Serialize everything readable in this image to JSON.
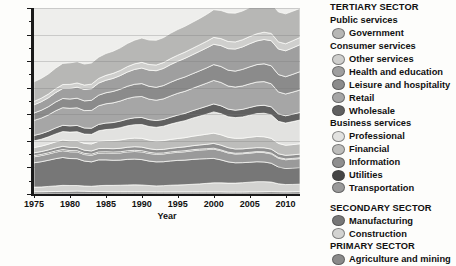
{
  "chart_data": {
    "type": "area",
    "title": "",
    "xlabel": "Year",
    "ylabel": "",
    "xlim": [
      1975,
      2012
    ],
    "ylim": [
      0,
      140
    ],
    "ytick_labels": [
      "0",
      "20",
      "40",
      "60",
      "80",
      "100",
      "120",
      "140"
    ],
    "ytick_values": [
      0,
      20,
      40,
      60,
      80,
      100,
      120,
      140
    ],
    "xtick_labels": [
      "1975",
      "1980",
      "1985",
      "1990",
      "1995",
      "2000",
      "2005",
      "2010"
    ],
    "xtick_values": [
      1975,
      1980,
      1985,
      1990,
      1995,
      2000,
      2005,
      2010
    ],
    "grid": true,
    "stacked": true,
    "legend_position": "right",
    "x": [
      1975,
      1976,
      1977,
      1978,
      1979,
      1980,
      1981,
      1982,
      1983,
      1984,
      1985,
      1986,
      1987,
      1988,
      1989,
      1990,
      1991,
      1992,
      1993,
      1994,
      1995,
      1996,
      1997,
      1998,
      1999,
      2000,
      2001,
      2002,
      2003,
      2004,
      2005,
      2006,
      2007,
      2008,
      2009,
      2010,
      2011,
      2012
    ],
    "series": [
      {
        "name": "Agriculture and mining",
        "sector": "PRIMARY SECTOR",
        "color": "#8a8a8a",
        "values": [
          1.7,
          1.7,
          1.8,
          1.9,
          2.0,
          2.1,
          2.2,
          2.1,
          1.9,
          1.9,
          1.8,
          1.7,
          1.7,
          1.7,
          1.7,
          1.7,
          1.7,
          1.6,
          1.6,
          1.6,
          1.6,
          1.6,
          1.6,
          1.6,
          1.6,
          1.6,
          1.6,
          1.5,
          1.5,
          1.5,
          1.6,
          1.6,
          1.7,
          1.8,
          1.7,
          1.6,
          1.7,
          1.8
        ]
      },
      {
        "name": "Construction",
        "sector": "SECONDARY SECTOR",
        "color": "#d3d3d1",
        "values": [
          3.5,
          3.6,
          3.9,
          4.2,
          4.5,
          4.3,
          4.2,
          3.9,
          3.9,
          4.4,
          4.7,
          4.8,
          4.9,
          5.1,
          5.2,
          5.1,
          4.7,
          4.5,
          4.7,
          5.0,
          5.2,
          5.4,
          5.7,
          6.0,
          6.4,
          6.8,
          6.8,
          6.7,
          6.7,
          7.0,
          7.3,
          7.7,
          7.6,
          7.2,
          6.0,
          5.5,
          5.5,
          5.6
        ]
      },
      {
        "name": "Manufacturing",
        "sector": "SECONDARY SECTOR",
        "color": "#777777",
        "values": [
          18.3,
          19.0,
          19.7,
          20.5,
          21.0,
          20.3,
          20.2,
          18.8,
          18.4,
          19.4,
          19.2,
          18.9,
          18.9,
          19.3,
          19.4,
          19.1,
          18.4,
          18.1,
          18.0,
          18.3,
          18.5,
          18.5,
          18.7,
          18.8,
          18.6,
          18.4,
          17.3,
          16.0,
          15.3,
          15.1,
          15.0,
          15.0,
          14.8,
          14.2,
          12.6,
          12.2,
          12.4,
          12.5
        ]
      },
      {
        "name": "Transportation",
        "sector": "Business services",
        "color": "#9a9a9a",
        "values": [
          4.5,
          4.6,
          4.7,
          4.9,
          5.1,
          5.1,
          5.1,
          4.9,
          4.9,
          5.1,
          5.2,
          5.3,
          5.4,
          5.6,
          5.7,
          5.8,
          5.7,
          5.7,
          5.8,
          6.0,
          6.1,
          6.3,
          6.5,
          6.7,
          6.8,
          7.0,
          6.9,
          6.7,
          6.6,
          6.7,
          6.9,
          7.0,
          7.1,
          7.0,
          6.6,
          6.5,
          6.6,
          6.8
        ]
      },
      {
        "name": "Utilities",
        "sector": "Business services",
        "color": "#454545",
        "values": [
          0.9,
          0.9,
          0.9,
          0.9,
          0.9,
          0.9,
          0.9,
          0.9,
          0.9,
          0.9,
          0.9,
          0.9,
          0.9,
          0.9,
          0.9,
          0.9,
          0.9,
          0.8,
          0.8,
          0.8,
          0.8,
          0.8,
          0.8,
          0.7,
          0.7,
          0.7,
          0.6,
          0.6,
          0.6,
          0.6,
          0.6,
          0.6,
          0.6,
          0.6,
          0.6,
          0.6,
          0.6,
          0.6
        ]
      },
      {
        "name": "Information",
        "sector": "Business services",
        "color": "#8f8f8f",
        "values": [
          2.1,
          2.1,
          2.2,
          2.3,
          2.4,
          2.4,
          2.4,
          2.4,
          2.4,
          2.5,
          2.5,
          2.5,
          2.6,
          2.6,
          2.7,
          2.7,
          2.7,
          2.7,
          2.7,
          2.7,
          2.8,
          2.9,
          3.0,
          3.1,
          3.3,
          3.6,
          3.6,
          3.4,
          3.2,
          3.1,
          3.1,
          3.0,
          3.0,
          3.0,
          2.8,
          2.7,
          2.7,
          2.7
        ]
      },
      {
        "name": "Financial",
        "sector": "Business services",
        "color": "#bdbdbb",
        "values": [
          4.0,
          4.1,
          4.3,
          4.5,
          4.7,
          4.9,
          5.0,
          5.1,
          5.3,
          5.5,
          5.8,
          6.1,
          6.3,
          6.4,
          6.5,
          6.6,
          6.5,
          6.5,
          6.6,
          6.7,
          6.8,
          6.9,
          7.1,
          7.3,
          7.6,
          7.7,
          7.8,
          7.8,
          8.0,
          8.0,
          8.2,
          8.4,
          8.3,
          8.1,
          7.8,
          7.6,
          7.7,
          7.8
        ]
      },
      {
        "name": "Professional",
        "sector": "Business services",
        "color": "#e2e2e0",
        "values": [
          5.0,
          5.2,
          5.5,
          6.0,
          6.4,
          6.6,
          6.9,
          7.0,
          7.2,
          7.9,
          8.4,
          8.7,
          9.2,
          9.7,
          10.1,
          10.4,
          10.2,
          10.3,
          10.8,
          11.5,
          12.2,
          12.8,
          13.6,
          14.3,
          15.1,
          16.0,
          15.9,
          15.5,
          15.6,
          16.0,
          16.6,
          17.2,
          17.7,
          17.7,
          16.6,
          16.7,
          17.3,
          17.9
        ]
      },
      {
        "name": "Wholesale",
        "sector": "Consumer services",
        "color": "#606060",
        "values": [
          4.1,
          4.2,
          4.3,
          4.5,
          4.7,
          4.7,
          4.7,
          4.6,
          4.6,
          4.8,
          4.9,
          4.9,
          5.0,
          5.1,
          5.2,
          5.3,
          5.2,
          5.1,
          5.1,
          5.2,
          5.4,
          5.5,
          5.6,
          5.8,
          5.9,
          6.0,
          5.9,
          5.7,
          5.6,
          5.7,
          5.8,
          5.9,
          6.0,
          6.0,
          5.6,
          5.5,
          5.6,
          5.7
        ]
      },
      {
        "name": "Retail",
        "sector": "Consumer services",
        "color": "#a6a6a6",
        "values": [
          11.3,
          11.7,
          12.2,
          12.9,
          13.3,
          13.2,
          13.3,
          13.1,
          13.4,
          14.0,
          14.5,
          14.8,
          15.1,
          15.5,
          15.7,
          15.8,
          15.4,
          15.3,
          15.5,
          16.0,
          16.4,
          16.6,
          16.8,
          17.1,
          17.4,
          17.7,
          17.6,
          17.4,
          17.4,
          17.6,
          17.8,
          17.9,
          17.8,
          17.4,
          16.5,
          16.4,
          16.6,
          16.9
        ]
      },
      {
        "name": "Leisure and hospitality",
        "sector": "Consumer services",
        "color": "#8b8b8b",
        "values": [
          5.6,
          5.9,
          6.2,
          6.6,
          6.9,
          7.0,
          7.2,
          7.3,
          7.6,
          8.0,
          8.3,
          8.6,
          8.9,
          9.2,
          9.5,
          9.7,
          9.7,
          9.7,
          10.0,
          10.3,
          10.5,
          10.8,
          11.0,
          11.2,
          11.5,
          11.9,
          12.0,
          11.9,
          12.0,
          12.5,
          12.8,
          13.1,
          13.4,
          13.5,
          13.1,
          13.0,
          13.4,
          13.8
        ]
      },
      {
        "name": "Health and education",
        "sector": "Consumer services",
        "color": "#9f9f9f",
        "values": [
          6.1,
          6.4,
          6.7,
          7.1,
          7.5,
          7.9,
          8.3,
          8.6,
          8.8,
          9.1,
          9.4,
          9.8,
          10.2,
          10.7,
          11.2,
          11.7,
          12.1,
          12.5,
          12.9,
          13.3,
          13.6,
          14.0,
          14.3,
          14.7,
          15.0,
          15.3,
          15.7,
          16.2,
          16.6,
          16.9,
          17.4,
          17.8,
          18.3,
          18.9,
          19.2,
          19.5,
          19.9,
          20.3
        ]
      },
      {
        "name": "Other services",
        "sector": "Consumer services",
        "color": "#cfcfcd",
        "values": [
          2.6,
          2.7,
          2.8,
          2.9,
          3.0,
          3.1,
          3.2,
          3.3,
          3.4,
          3.5,
          3.7,
          3.8,
          3.9,
          4.1,
          4.2,
          4.3,
          4.3,
          4.3,
          4.4,
          4.5,
          4.6,
          4.7,
          4.8,
          4.9,
          5.0,
          5.2,
          5.3,
          5.4,
          5.4,
          5.4,
          5.4,
          5.4,
          5.5,
          5.5,
          5.4,
          5.3,
          5.4,
          5.4
        ]
      },
      {
        "name": "Government",
        "sector": "Public services",
        "color": "#b7b7b5",
        "values": [
          14.7,
          14.9,
          15.1,
          15.5,
          15.9,
          16.2,
          16.0,
          15.8,
          15.9,
          16.0,
          16.4,
          16.7,
          17.0,
          17.4,
          17.8,
          18.3,
          18.4,
          18.6,
          18.8,
          19.1,
          19.3,
          19.4,
          19.6,
          19.8,
          20.2,
          20.8,
          21.1,
          21.5,
          21.6,
          21.6,
          21.8,
          22.0,
          22.2,
          22.5,
          22.5,
          22.5,
          22.2,
          21.9
        ]
      }
    ]
  },
  "legend": {
    "groups": [
      {
        "kind": "sector",
        "label": "TERTIARY SECTOR"
      },
      {
        "kind": "group",
        "label": "Public services"
      },
      {
        "kind": "item",
        "label": "Government",
        "color": "#b7b7b5"
      },
      {
        "kind": "group",
        "label": "Consumer services"
      },
      {
        "kind": "item",
        "label": "Other services",
        "color": "#cfcfcd"
      },
      {
        "kind": "item",
        "label": "Health and education",
        "color": "#9f9f9f"
      },
      {
        "kind": "item",
        "label": "Leisure and hospitality",
        "color": "#8b8b8b"
      },
      {
        "kind": "item",
        "label": "Retail",
        "color": "#a6a6a6"
      },
      {
        "kind": "item",
        "label": "Wholesale",
        "color": "#606060"
      },
      {
        "kind": "group",
        "label": "Business services"
      },
      {
        "kind": "item",
        "label": "Professional",
        "color": "#e2e2e0"
      },
      {
        "kind": "item",
        "label": "Financial",
        "color": "#bdbdbb"
      },
      {
        "kind": "item",
        "label": "Information",
        "color": "#8f8f8f"
      },
      {
        "kind": "item",
        "label": "Utilities",
        "color": "#454545"
      },
      {
        "kind": "item",
        "label": "Transportation",
        "color": "#9a9a9a"
      },
      {
        "kind": "spacer",
        "label": ""
      },
      {
        "kind": "sector",
        "label": "SECONDARY SECTOR"
      },
      {
        "kind": "item",
        "label": "Manufacturing",
        "color": "#777777"
      },
      {
        "kind": "item",
        "label": "Construction",
        "color": "#d3d3d1"
      },
      {
        "kind": "sector",
        "label": "PRIMARY SECTOR"
      },
      {
        "kind": "item",
        "label": "Agriculture and mining",
        "color": "#8a8a8a"
      }
    ]
  }
}
